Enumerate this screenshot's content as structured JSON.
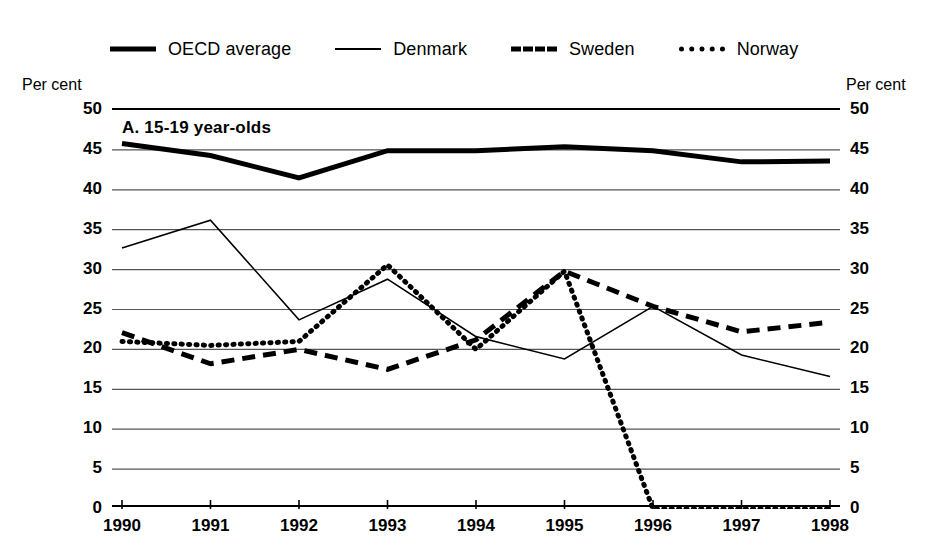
{
  "figure": {
    "panel_label": "A. 15-19 year-olds",
    "axis_caption_left": "Per cent",
    "axis_caption_right": "Per cent"
  },
  "legend": {
    "position": "top",
    "items": [
      {
        "label": "OECD average",
        "style": "solid-thick",
        "icon": "line-solid-thick-icon"
      },
      {
        "label": "Denmark",
        "style": "solid-thin",
        "icon": "line-solid-thin-icon"
      },
      {
        "label": "Sweden",
        "style": "dashed",
        "icon": "line-dashed-icon"
      },
      {
        "label": "Norway",
        "style": "dotted",
        "icon": "line-dotted-icon"
      }
    ]
  },
  "chart_data": {
    "type": "line",
    "title": "A. 15-19 year-olds",
    "xlabel": "",
    "ylabel": "Per cent",
    "ylim": [
      0,
      50
    ],
    "yticks": [
      0,
      5,
      10,
      15,
      20,
      25,
      30,
      35,
      40,
      45,
      50
    ],
    "ytick_labels": [
      "0",
      "5",
      "10",
      "15",
      "20",
      "25",
      "30",
      "35",
      "40",
      "45",
      "50"
    ],
    "grid": true,
    "dual_axis": true,
    "categories": [
      1990,
      1991,
      1992,
      1993,
      1994,
      1995,
      1996,
      1997,
      1998
    ],
    "xtick_labels": [
      "1990",
      "1991",
      "1992",
      "1993",
      "1994",
      "1995",
      "1996",
      "1997",
      "1998"
    ],
    "series": [
      {
        "name": "OECD average",
        "style": "solid-thick",
        "color": "#000000",
        "values": [
          45.8,
          44.3,
          41.5,
          44.9,
          44.9,
          45.4,
          44.9,
          43.5,
          43.6
        ]
      },
      {
        "name": "Denmark",
        "style": "solid-thin",
        "color": "#000000",
        "values": [
          32.7,
          36.2,
          23.7,
          28.8,
          21.6,
          18.8,
          25.4,
          19.3,
          16.6
        ]
      },
      {
        "name": "Sweden",
        "style": "dashed",
        "color": "#000000",
        "values": [
          22.1,
          18.2,
          20.0,
          17.5,
          21.2,
          29.8,
          25.4,
          22.2,
          23.4
        ]
      },
      {
        "name": "Norway",
        "style": "dotted",
        "color": "#000000",
        "values": [
          21.0,
          20.5,
          21.0,
          30.6,
          20.0,
          29.8,
          0.0,
          0.0,
          0.0
        ]
      }
    ]
  },
  "colors": {
    "ink": "#000000",
    "gridline": "#555555",
    "background": "#ffffff"
  }
}
